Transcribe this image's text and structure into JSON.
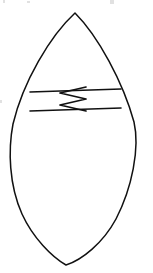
{
  "canvas": {
    "width": 153,
    "height": 273,
    "background_color": "#ffffff",
    "ink_color": "#111111",
    "description": "Hand-drawn black line diagram on a white page"
  },
  "figure": {
    "name": "leaf-vesica-outline",
    "label": "Pointed oval leaf outline",
    "stroke_color": "#111111",
    "stroke_width": 1.5,
    "apex_top": {
      "x": 75,
      "y": 13
    },
    "apex_bottom": {
      "x": 66,
      "y": 265
    },
    "widest_left": {
      "x": 11,
      "y": 140
    },
    "widest_right": {
      "x": 137,
      "y": 138
    }
  },
  "markings": {
    "top_rule": {
      "label": "Upper horizontal line",
      "x1": 30,
      "y1": 92,
      "x2": 121,
      "y2": 89,
      "stroke_width": 1.6
    },
    "bottom_rule": {
      "label": "Lower horizontal line",
      "x1": 30,
      "y1": 111,
      "x2": 121,
      "y2": 108,
      "stroke_width": 1.6
    },
    "zigzag": {
      "label": "Vertical zigzag between the two rules",
      "peaks": 3,
      "left_x": 60,
      "right_x": 86,
      "top_y": 87,
      "bottom_y": 111,
      "stroke_width": 1.7,
      "points": "86,87 60,93 86,99 60,105 86,111"
    }
  },
  "artifacts": {
    "label": "Faint cropped marks along the top edge",
    "marks": [
      {
        "x": 3,
        "y": 0,
        "w": 2,
        "h": 3
      },
      {
        "x": 27,
        "y": 1,
        "w": 3,
        "h": 2
      },
      {
        "x": 110,
        "y": 0,
        "w": 4,
        "h": 4
      },
      {
        "x": 0,
        "y": 100,
        "w": 2,
        "h": 3
      }
    ]
  }
}
